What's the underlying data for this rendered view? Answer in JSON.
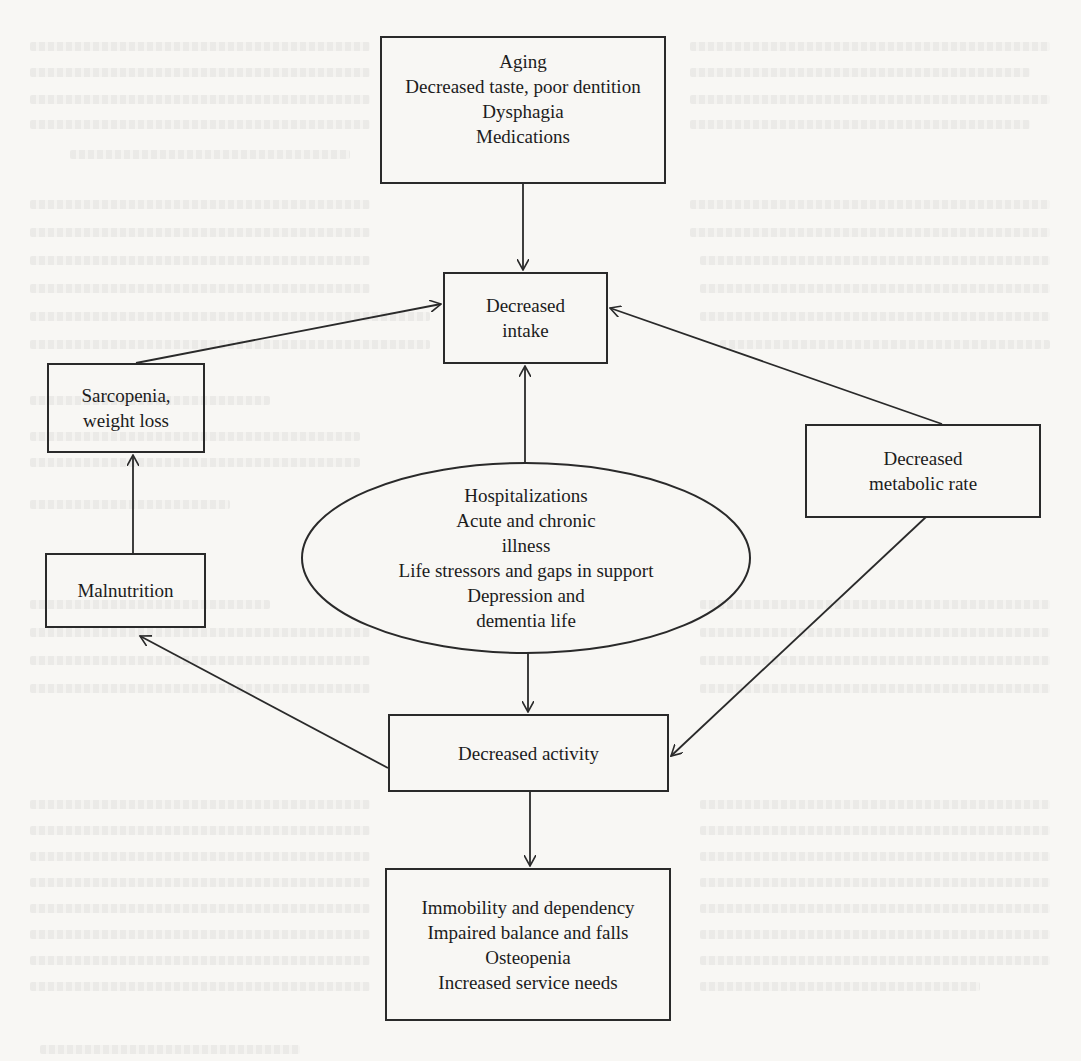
{
  "diagram": {
    "type": "flowchart",
    "nodes": {
      "aging_factors": {
        "shape": "rectangle",
        "lines": [
          "Aging",
          "Decreased taste, poor dentition",
          "Dysphagia",
          "Medications"
        ]
      },
      "decreased_intake": {
        "shape": "rectangle",
        "lines": [
          "Decreased",
          "intake"
        ]
      },
      "sarcopenia": {
        "shape": "rectangle",
        "lines": [
          "Sarcopenia,",
          "weight loss"
        ]
      },
      "metabolic_rate": {
        "shape": "rectangle",
        "lines": [
          "Decreased",
          "metabolic rate"
        ]
      },
      "stressors": {
        "shape": "ellipse",
        "lines": [
          "Hospitalizations",
          "Acute and chronic",
          "illness",
          "Life stressors and gaps in support",
          "Depression and",
          "dementia life"
        ]
      },
      "malnutrition": {
        "shape": "rectangle",
        "lines": [
          "Malnutrition"
        ]
      },
      "decreased_activity": {
        "shape": "rectangle",
        "lines": [
          "Decreased activity"
        ]
      },
      "outcomes": {
        "shape": "rectangle",
        "lines": [
          "Immobility and dependency",
          "Impaired balance and falls",
          "Osteopenia",
          "Increased service needs"
        ]
      }
    },
    "edges": [
      {
        "from": "aging_factors",
        "to": "decreased_intake"
      },
      {
        "from": "sarcopenia",
        "to": "decreased_intake"
      },
      {
        "from": "metabolic_rate",
        "to": "decreased_intake"
      },
      {
        "from": "stressors",
        "to": "decreased_intake"
      },
      {
        "from": "stressors",
        "to": "decreased_activity"
      },
      {
        "from": "metabolic_rate",
        "to": "decreased_activity"
      },
      {
        "from": "decreased_activity",
        "to": "malnutrition"
      },
      {
        "from": "malnutrition",
        "to": "sarcopenia"
      },
      {
        "from": "decreased_activity",
        "to": "outcomes"
      }
    ],
    "colors": {
      "stroke": "#2a2a2a",
      "text": "#1c1c1c",
      "paper": "#f8f7f4"
    }
  }
}
